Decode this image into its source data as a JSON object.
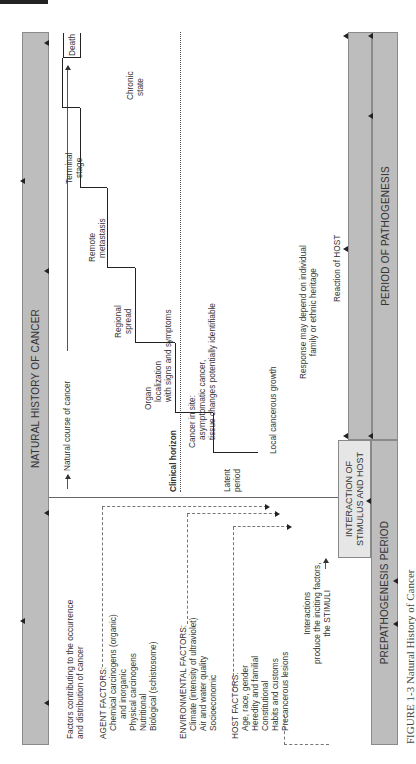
{
  "figure": {
    "caption": "FIGURE 1-3 Natural History of Cancer",
    "top_bar_label": "NATURAL HISTORY OF CANCER",
    "bottom_left_bar_label": "PREPATHOGENESIS PERIOD",
    "bottom_right_bar_label": "PERIOD OF PATHOGENESIS",
    "interaction_box": [
      "INTERACTION OF",
      "STIMULUS AND HOST"
    ]
  },
  "left_panel": {
    "heading": [
      "Factors contributing to the occurrence",
      "and distribution of cancer"
    ],
    "agent_factors": {
      "title": "AGENT FACTORS:",
      "items": [
        "Chemical carcinogens (organic)",
        "and inorganic",
        "Physical carcinogens",
        "Nutritional",
        "Biological (schistosome)"
      ]
    },
    "environmental_factors": {
      "title": "ENVIRONMENTAL FACTORS:",
      "items": [
        "Climate (intensity of ultraviolet)",
        "Air and water quality",
        "Socioeconomic"
      ]
    },
    "host_factors": {
      "title": "HOST FACTORS:",
      "items": [
        "Age, race, gender",
        "Heredity and familial",
        "Constitutional",
        "Habits and customs",
        "Precancerous lesions"
      ]
    },
    "interactions": [
      "Interactions",
      "produce the inciting factors,",
      "the STIMULI"
    ]
  },
  "right_panel": {
    "course_label": "Natural course of cancer",
    "clinical_horizon": "Clinical horizon",
    "stages": [
      {
        "label": [
          "Latent",
          "period"
        ]
      },
      {
        "label": [
          "Cancer in site:",
          "asymptomatic cancer,",
          "tissue changes potentially identifiable"
        ]
      },
      {
        "label": [
          "Organ",
          "localization",
          "with signs and symptoms"
        ]
      },
      {
        "label": [
          "Regional",
          "spread"
        ]
      },
      {
        "label": [
          "Remote",
          "metastasis"
        ]
      },
      {
        "label": [
          "Terminal",
          "stage"
        ]
      },
      {
        "label": [
          "Death"
        ]
      }
    ],
    "chronic_state": [
      "Chronic",
      "state"
    ],
    "local_growth": "Local cancerous growth",
    "response": [
      "Response may depend on individual",
      "family or ethnic heritage"
    ],
    "reaction": "Reaction of HOST"
  }
}
